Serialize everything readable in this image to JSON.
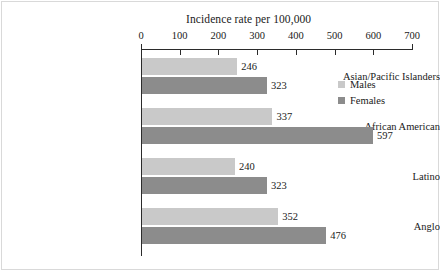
{
  "chart_data": {
    "type": "bar",
    "orientation": "horizontal",
    "title": "Incidence rate per 100,000",
    "xlabel": "",
    "ylabel": "",
    "xlim": [
      0,
      700
    ],
    "xticks": [
      0,
      100,
      200,
      300,
      400,
      500,
      600,
      700
    ],
    "xtick_labels": [
      "0",
      "100",
      "200",
      "300",
      "400",
      "500",
      "600",
      "700"
    ],
    "grid": false,
    "legend_position": "right",
    "categories": [
      "Asian/Pacific Islanders",
      "African American",
      "Latino",
      "Anglo"
    ],
    "series": [
      {
        "name": "Males",
        "color": "#c9c9c9",
        "values": [
          246,
          337,
          240,
          352
        ]
      },
      {
        "name": "Females",
        "color": "#8c8c8c",
        "values": [
          323,
          597,
          323,
          476
        ]
      }
    ],
    "data_labels": {
      "Asian/Pacific Islanders": {
        "Males": "246",
        "Females": "323"
      },
      "African American": {
        "Males": "337",
        "Females": "597"
      },
      "Latino": {
        "Males": "240",
        "Females": "323"
      },
      "Anglo": {
        "Males": "352",
        "Females": "476"
      }
    }
  },
  "legend": {
    "items": [
      {
        "label": "Males",
        "color": "#c9c9c9"
      },
      {
        "label": "Females",
        "color": "#8c8c8c"
      }
    ]
  }
}
